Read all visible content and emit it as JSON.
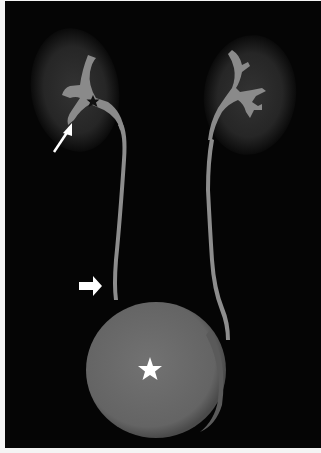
{
  "figure": {
    "type": "MR urography (maximum intensity projection)",
    "colors": {
      "background": "#050505",
      "border": "#f4f4f4",
      "kidney_parenchyma": "#2a2a2a",
      "collecting_system": "#8a8a8a",
      "bladder": "#6e6e6e",
      "markers": "#ffffff",
      "star_dark": "#111111"
    },
    "annotations": [
      {
        "id": "thin-arrow",
        "description": "white thin arrow pointing to right lower-pole calyx",
        "position": [
          50,
          180
        ]
      },
      {
        "id": "dark-star",
        "description": "black star on right renal pelvis",
        "position": [
          93,
          101
        ]
      },
      {
        "id": "block-arrow",
        "description": "white thick arrow pointing to right distal ureter",
        "position": [
          85,
          287
        ]
      },
      {
        "id": "white-star",
        "description": "white star on distended bladder",
        "position": [
          149,
          369
        ]
      }
    ]
  }
}
